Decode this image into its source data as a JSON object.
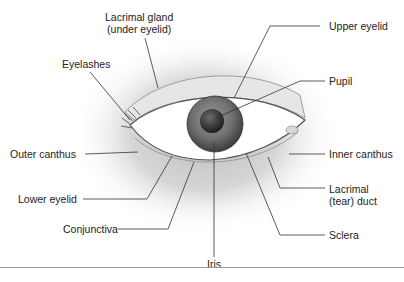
{
  "diagram": {
    "labels": {
      "lacrimal_gland_line1": "Lacrimal gland",
      "lacrimal_gland_line2": "(under eyelid)",
      "upper_eyelid": "Upper eyelid",
      "eyelashes": "Eyelashes",
      "pupil": "Pupil",
      "outer_canthus": "Outer canthus",
      "inner_canthus": "Inner canthus",
      "lower_eyelid": "Lower eyelid",
      "lacrimal_duct_line1": "Lacrimal",
      "lacrimal_duct_line2": "(tear) duct",
      "conjunctiva": "Conjunctiva",
      "sclera": "Sclera",
      "iris": "Iris"
    },
    "colors": {
      "background": "#ffffff",
      "leader_line": "#333333",
      "skin_shadow": "#c8c8c8",
      "iris": "#6e6e6e",
      "pupil": "#2a2a2a",
      "sclera": "#ffffff"
    }
  }
}
